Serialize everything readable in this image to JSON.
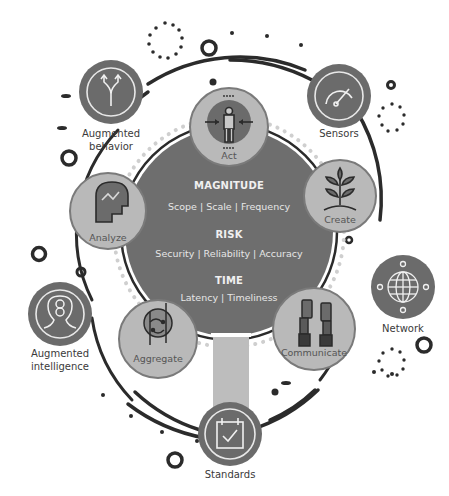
{
  "colors": {
    "center_fill": "#6e6e6e",
    "node_fill": "#b9b9b9",
    "node_stroke": "#7a7a7a",
    "outer_node_fill": "#6b6b6b",
    "ring_stroke": "#2b2b2b",
    "dot_color": "#c9c9c9",
    "bar_fill": "#bdbdbd"
  },
  "center": {
    "sections": [
      {
        "heading": "MAGNITUDE",
        "items_text": "Scope  |  Scale  |  Frequency"
      },
      {
        "heading": "RISK",
        "items_text": "Security  |  Reliability  |  Accuracy"
      },
      {
        "heading": "TIME",
        "items_text": "Latency  |  Timeliness"
      }
    ]
  },
  "inner_nodes": [
    {
      "label": "Act",
      "icon": "person-target-icon"
    },
    {
      "label": "Create",
      "icon": "plant-sprout-icon"
    },
    {
      "label": "Communicate",
      "icon": "hands-phones-icon"
    },
    {
      "label": "Aggregate",
      "icon": "circuit-merge-icon"
    },
    {
      "label": "Analyze",
      "icon": "head-graph-icon"
    }
  ],
  "outer_nodes": [
    {
      "label_line1": "Augmented",
      "label_line2": "behavior",
      "icon": "fork-arrows-icon"
    },
    {
      "label_line1": "Sensors",
      "label_line2": "",
      "icon": "gauge-icon"
    },
    {
      "label_line1": "Network",
      "label_line2": "",
      "icon": "globe-network-icon"
    },
    {
      "label_line1": "Standards",
      "label_line2": "",
      "icon": "calendar-check-icon"
    },
    {
      "label_line1": "Augmented",
      "label_line2": "intelligence",
      "icon": "head-brain-icon"
    }
  ]
}
